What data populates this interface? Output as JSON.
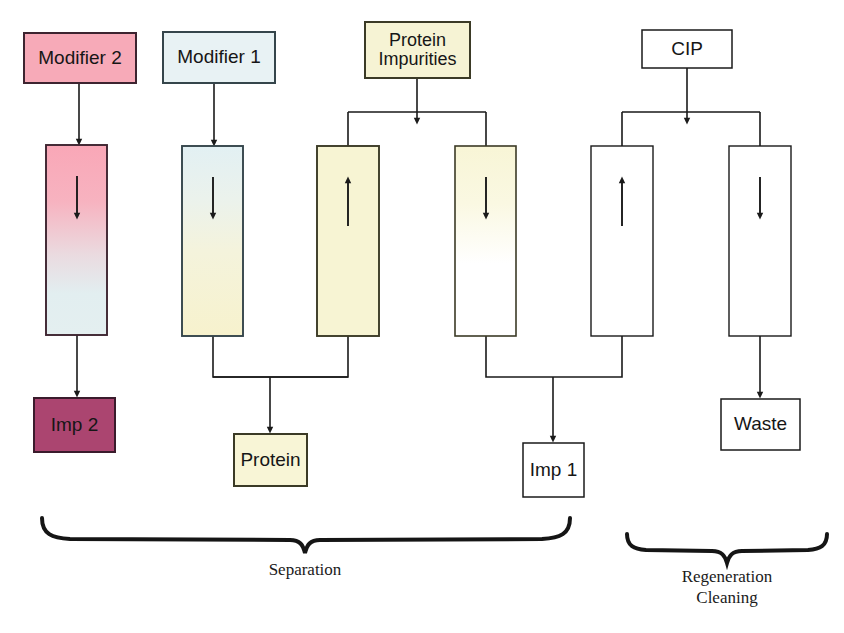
{
  "diagram": {
    "background_color": "#ffffff",
    "stroke_color": "#1a1a1a",
    "feed_boxes": [
      {
        "id": "modifier-2",
        "label": "Modifier 2",
        "x": 24,
        "y": 33,
        "w": 112,
        "h": 50,
        "fill": "#f7aab8",
        "stroke": "#3d2430",
        "font_size": 19
      },
      {
        "id": "modifier-1",
        "label": "Modifier 1",
        "x": 163,
        "y": 32,
        "w": 112,
        "h": 51,
        "fill": "#e8f2f4",
        "stroke": "#35454b",
        "font_size": 19
      },
      {
        "id": "protein-impurities",
        "label": "Protein\nImpurities",
        "x": 365,
        "y": 22,
        "w": 105,
        "h": 56,
        "fill": "#f6f3d4",
        "stroke": "#3b3a26",
        "font_size": 18
      },
      {
        "id": "cip",
        "label": "CIP",
        "x": 642,
        "y": 30,
        "w": 90,
        "h": 38,
        "fill": "#ffffff",
        "stroke": "#1a1a1a",
        "font_size": 19
      }
    ],
    "columns": [
      {
        "id": "column-1",
        "x": 46,
        "y": 145,
        "w": 61,
        "h": 190,
        "stroke": "#3d2430",
        "arrow_direction": "down",
        "gradient": {
          "from": "#f9a7b7",
          "to": "#e4eff0"
        },
        "gradient_stops": [
          0,
          58,
          100
        ]
      },
      {
        "id": "column-2",
        "x": 182,
        "y": 146,
        "w": 61,
        "h": 190,
        "stroke": "#35454b",
        "arrow_direction": "down",
        "gradient": {
          "from": "#e2f0f3",
          "to": "#f7f2cd"
        },
        "gradient_stops": [
          0,
          55,
          100
        ]
      },
      {
        "id": "column-3",
        "x": 317,
        "y": 146,
        "w": 62,
        "h": 190,
        "stroke": "#3b3a26",
        "arrow_direction": "up",
        "gradient": {
          "from": "#f7f4d3",
          "to": "#f7f4d3"
        },
        "gradient_stops": [
          0,
          50,
          100
        ]
      },
      {
        "id": "column-4",
        "x": 455,
        "y": 146,
        "w": 61,
        "h": 190,
        "stroke": "#3b3a26",
        "arrow_direction": "down",
        "gradient": {
          "from": "#f8f5d6",
          "to": "#ffffff"
        },
        "gradient_stops": [
          0,
          30,
          62
        ]
      },
      {
        "id": "column-5",
        "x": 591,
        "y": 146,
        "w": 62,
        "h": 190,
        "stroke": "#1a1a1a",
        "arrow_direction": "up",
        "gradient": {
          "from": "#ffffff",
          "to": "#ffffff"
        },
        "gradient_stops": [
          0,
          50,
          100
        ]
      },
      {
        "id": "column-6",
        "x": 729,
        "y": 146,
        "w": 62,
        "h": 190,
        "stroke": "#1a1a1a",
        "arrow_direction": "down",
        "gradient": {
          "from": "#ffffff",
          "to": "#ffffff"
        },
        "gradient_stops": [
          0,
          50,
          100
        ]
      }
    ],
    "product_boxes": [
      {
        "id": "imp-2",
        "label": "Imp 2",
        "x": 34,
        "y": 398,
        "w": 81,
        "h": 54,
        "fill": "#ab4570",
        "stroke": "#3a1b2c",
        "font_size": 19
      },
      {
        "id": "protein",
        "label": "Protein",
        "x": 234,
        "y": 434,
        "w": 73,
        "h": 52,
        "fill": "#f8f5d6",
        "stroke": "#3b3a26",
        "font_size": 19
      },
      {
        "id": "imp-1",
        "label": "Imp 1",
        "x": 523,
        "y": 443,
        "w": 61,
        "h": 54,
        "fill": "#ffffff",
        "stroke": "#1a1a1a",
        "font_size": 19
      },
      {
        "id": "waste",
        "label": "Waste",
        "x": 721,
        "y": 399,
        "w": 79,
        "h": 51,
        "fill": "#ffffff",
        "stroke": "#1a1a1a",
        "font_size": 19
      }
    ],
    "braces": [
      {
        "id": "brace-separation",
        "label": "Separation",
        "x_start": 40,
        "x_end": 570,
        "y": 520,
        "label_x": 305,
        "label_y": 566,
        "font_size": 17
      },
      {
        "id": "brace-regeneration",
        "label": "Regeneration\nCleaning",
        "x_start": 625,
        "x_end": 830,
        "y": 536,
        "label_x": 727,
        "label_y": 574,
        "font_size": 17
      }
    ],
    "connectors": [
      {
        "id": "modifier2-to-column1",
        "type": "straight-arrow",
        "from": "modifier-2",
        "to": "column-1"
      },
      {
        "id": "modifier1-to-column2",
        "type": "straight-arrow",
        "from": "modifier-1",
        "to": "column-2"
      },
      {
        "id": "protein-impurities-split",
        "type": "split-down",
        "from": "protein-impurities",
        "to": [
          "column-3",
          "column-4"
        ]
      },
      {
        "id": "cip-split",
        "type": "split-down",
        "from": "cip",
        "to": [
          "column-5",
          "column-6"
        ]
      },
      {
        "id": "column1-to-imp2",
        "type": "straight-arrow",
        "from": "column-1",
        "to": "imp-2"
      },
      {
        "id": "column2-column3-merge-to-protein",
        "type": "merge-down",
        "from": [
          "column-2",
          "column-3"
        ],
        "to": "protein"
      },
      {
        "id": "column4-column5-merge-to-imp1",
        "type": "merge-down",
        "from": [
          "column-4",
          "column-5"
        ],
        "to": "imp-1"
      },
      {
        "id": "column6-to-waste",
        "type": "straight-arrow",
        "from": "column-6",
        "to": "waste"
      }
    ]
  }
}
